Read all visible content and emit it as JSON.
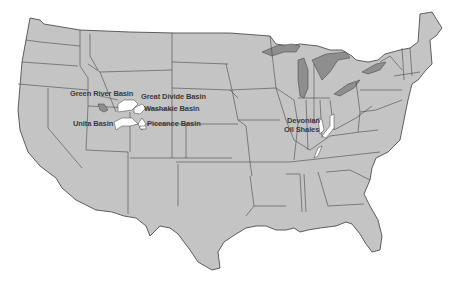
{
  "map": {
    "title": "Oil shale deposits of the United States",
    "colors": {
      "land": "#c4c4c4",
      "border": "#3c3c3c",
      "lakes": "#8e8e8e",
      "deposit": "#ffffff",
      "label": "#3a3a3a"
    },
    "labels": [
      {
        "id": "green-river",
        "text": "Green River Basin"
      },
      {
        "id": "great-divide",
        "text": "Great Divide Basin"
      },
      {
        "id": "washakie",
        "text": "Washakie Basin"
      },
      {
        "id": "unita",
        "text": "Unita Basin"
      },
      {
        "id": "piceance",
        "text": "Piceance Basin"
      },
      {
        "id": "devonian-1",
        "text": "Devonian"
      },
      {
        "id": "devonian-2",
        "text": "Oil Shales"
      }
    ]
  }
}
